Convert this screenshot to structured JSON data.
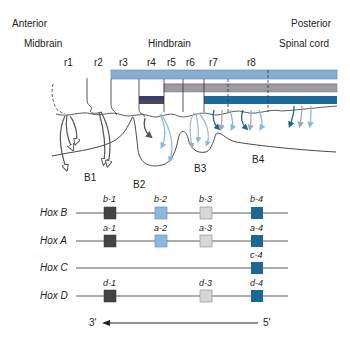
{
  "header": {
    "anterior": "Anterior",
    "posterior": "Posterior",
    "regions": {
      "midbrain": "Midbrain",
      "hindbrain": "Hindbrain",
      "spinal_cord": "Spinal cord"
    }
  },
  "rhombomeres": [
    "r1",
    "r2",
    "r3",
    "r4",
    "r5",
    "r6",
    "r7",
    "r8"
  ],
  "branchial_arches": [
    "B1",
    "B2",
    "B3",
    "B4"
  ],
  "colors": {
    "hoxb_bar": "#86aed3",
    "hoxa_bar": "#9a9ca0",
    "hoxc_bar": "#1b6a9a",
    "group1": "#444448",
    "group2": "#8db8de",
    "group3": "#d6d7da",
    "group4": "#1d6796",
    "outline": "#444444"
  },
  "hox_clusters": [
    {
      "name": "Hox B",
      "genes": [
        {
          "label": "b-1",
          "group": 1
        },
        {
          "label": "b-2",
          "group": 2
        },
        {
          "label": "b-3",
          "group": 3
        },
        {
          "label": "b-4",
          "group": 4
        }
      ]
    },
    {
      "name": "Hox A",
      "genes": [
        {
          "label": "a-1",
          "group": 1
        },
        {
          "label": "a-2",
          "group": 2
        },
        {
          "label": "a-3",
          "group": 3
        },
        {
          "label": "a-4",
          "group": 4
        }
      ]
    },
    {
      "name": "Hox C",
      "genes": [
        {
          "label": "c-4",
          "group": 4
        }
      ]
    },
    {
      "name": "Hox D",
      "genes": [
        {
          "label": "d-1",
          "group": 1
        },
        {
          "label": "d-3",
          "group": 3
        },
        {
          "label": "d-4",
          "group": 4
        }
      ]
    }
  ],
  "axis": {
    "left": "3'",
    "right": "5'"
  }
}
